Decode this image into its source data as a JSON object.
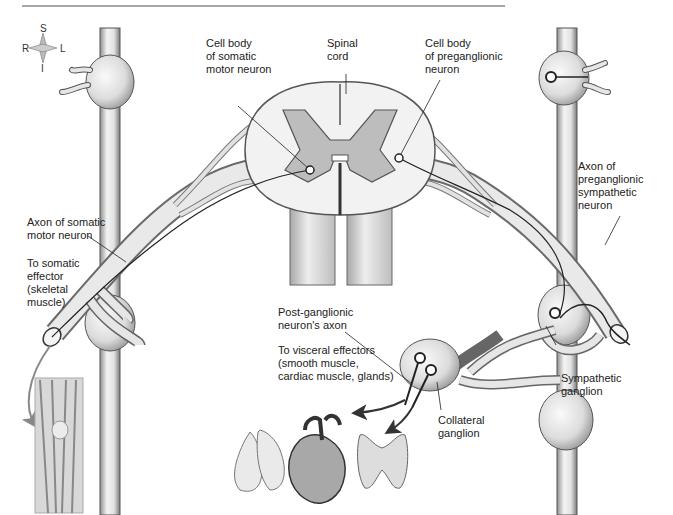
{
  "figure": {
    "type": "anatomical-diagram"
  },
  "compass": {
    "superior": "S",
    "inferior": "I",
    "right": "R",
    "left": "L"
  },
  "labels": {
    "cell_body_somatic": "Cell body\nof somatic\nmotor neuron",
    "spinal_cord": "Spinal\ncord",
    "cell_body_preganglionic": "Cell body\nof preganglionic\nneuron",
    "axon_preganglionic": "Axon of\npreganglionic\nsympathetic\nneuron",
    "axon_somatic": "Axon of somatic\nmotor neuron",
    "to_somatic_effector": "To somatic\neffector\n(skeletal\nmuscle)",
    "postganglionic_axon": "Post-ganglionic\nneuron's axon",
    "to_visceral_effectors": "To visceral effectors\n(smooth muscle,\ncardiac muscle, glands)",
    "sympathetic_ganglion": "Sympathetic\nganglion",
    "collateral_ganglion": "Collateral\nganglion"
  },
  "organs": [
    "skeletal-muscle-knee",
    "lungs",
    "heart",
    "thyroid-gland"
  ],
  "colors": {
    "tissue_fill": "#e8e8e8",
    "tissue_shadow": "#9a9a9a",
    "outline": "#333333",
    "grey_matter": "#bdbdbd",
    "white_matter": "#f2f2f2",
    "arrow": "#333333",
    "header_rule": "#888888"
  }
}
